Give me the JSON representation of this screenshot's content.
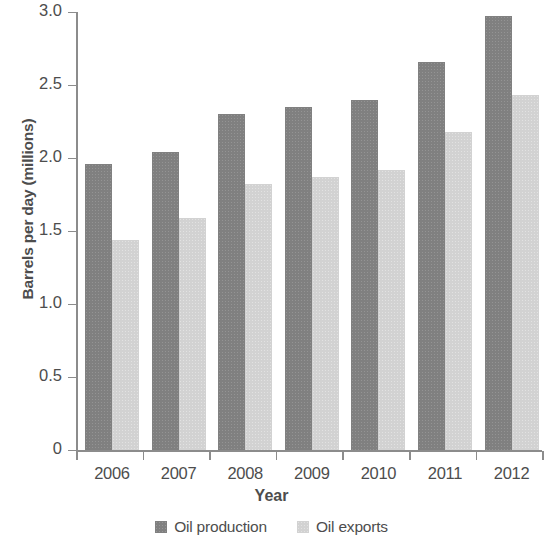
{
  "chart_data": {
    "type": "bar",
    "title": "",
    "subtitle": "",
    "xlabel": "Year",
    "ylabel": "Barrels per day (millions)",
    "categories": [
      "2006",
      "2007",
      "2008",
      "2009",
      "2010",
      "2011",
      "2012"
    ],
    "series": [
      {
        "name": "Oil production",
        "color": "#808080",
        "values": [
          1.96,
          2.04,
          2.3,
          2.35,
          2.4,
          2.66,
          2.97
        ]
      },
      {
        "name": "Oil exports",
        "color": "#d2d2d2",
        "values": [
          1.44,
          1.59,
          1.82,
          1.87,
          1.92,
          2.18,
          2.43
        ]
      }
    ],
    "ylim": [
      0,
      3.0
    ],
    "ytick_labels": [
      "3.0",
      "2.5",
      "2.0",
      "1.5",
      "1.0",
      "0.5",
      "0"
    ],
    "ytick_values": [
      3.0,
      2.5,
      2.0,
      1.5,
      1.0,
      0.5,
      0
    ],
    "grid": false,
    "legend_position": "bottom",
    "legend_entries": [
      "Oil production",
      "Oil exports"
    ]
  },
  "axes": {
    "y_title": "Barrels per day (millions)",
    "x_title": "Year"
  },
  "colors": {
    "production": "#808080",
    "exports": "#d2d2d2",
    "axis": "#8c8c8c",
    "text": "#4d4d4d",
    "background": "#ffffff"
  }
}
